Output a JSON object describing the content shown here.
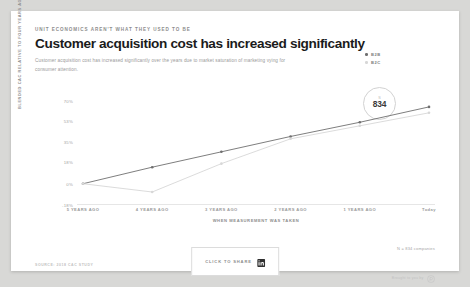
{
  "header": {
    "eyebrow": "UNIT ECONOMICS AREN'T WHAT THEY USED TO BE",
    "title": "Customer acquisition cost has increased significantly",
    "subtitle": "Customer acquisition cost has increased significantly over the years due to market saturation of marketing vying for consumer attention."
  },
  "badge": {
    "sup": "N",
    "value": "834"
  },
  "footer": {
    "source": "SOURCE: 2018 CAC STUDY",
    "share_label": "CLICK TO SHARE",
    "share_icon": "linkedin-icon",
    "sample_note": "N = 834 companies",
    "brought_label": "Brought to you by",
    "brought_icon": "brand-logo-icon"
  },
  "colors": {
    "b2b": "#6f6f6f",
    "b2c": "#d7d7d7",
    "text_dark": "#1b1b1b",
    "text_muted": "#9a9a9a",
    "axis": "#e6e6e6"
  },
  "chart_data": {
    "type": "line",
    "title": "Customer acquisition cost has increased significantly",
    "xlabel": "WHEN MEASUREMENT WAS TAKEN",
    "ylabel": "BLENDED CAC RELATIVE TO FOUR YEARS AGO",
    "categories": [
      "5 YEARS AGO",
      "4 YEARS AGO",
      "3 YEARS AGO",
      "2 YEARS AGO",
      "1 YEARS AGO",
      "Today"
    ],
    "ytick_labels": [
      "70%",
      "53%",
      "35%",
      "18%",
      "0%",
      "-18%"
    ],
    "ytick_values": [
      70,
      53,
      35,
      18,
      0,
      -18
    ],
    "ylim": [
      -18,
      70
    ],
    "grid": false,
    "legend_position": "top-right",
    "series": [
      {
        "name": "B2B",
        "color": "#6f6f6f",
        "values": [
          0,
          14,
          27,
          40,
          52,
          65
        ]
      },
      {
        "name": "B2C",
        "color": "#d7d7d7",
        "values": [
          0,
          -7,
          17,
          38,
          49,
          60
        ]
      }
    ]
  }
}
